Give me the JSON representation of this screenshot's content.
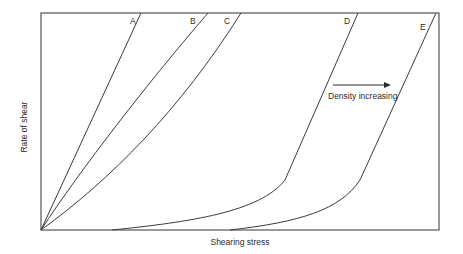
{
  "diagram": {
    "x_axis_label": "Shearing stress",
    "y_axis_label": "Rate of shear",
    "annotation": "Density increasing",
    "curves": [
      {
        "label": "A",
        "type": "newtonian-steep"
      },
      {
        "label": "B",
        "type": "slightly-shear-thinning"
      },
      {
        "label": "C",
        "type": "shear-thinning"
      },
      {
        "label": "D",
        "type": "yield-stress"
      },
      {
        "label": "E",
        "type": "yield-stress-higher"
      }
    ],
    "colors": {
      "line": "#3a3a3a",
      "text": "#2a2a2a",
      "background": "#ffffff"
    }
  }
}
